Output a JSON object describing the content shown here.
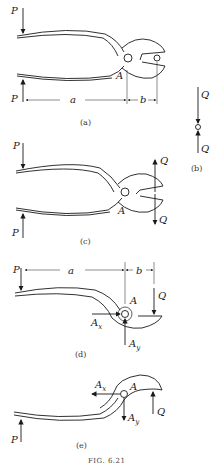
{
  "figure": {
    "caption": "FIG. 6.21",
    "panels": {
      "a": {
        "label": "(a)",
        "forces": {
          "top": "P",
          "bottom": "P"
        },
        "pivot": "A",
        "dimensions": {
          "handle": "a",
          "jaw": "b"
        }
      },
      "b": {
        "label": "(b)",
        "forces": {
          "top": "Q",
          "bottom": "Q"
        }
      },
      "c": {
        "label": "(c)",
        "forces": {
          "top_left": "P",
          "bottom_left": "P",
          "top_right": "Q",
          "bottom_right": "Q"
        },
        "pivot": "A"
      },
      "d": {
        "label": "(d)",
        "forces": {
          "load": "P",
          "jaw": "Q",
          "pin_x": "A",
          "pin_x_sub": "x",
          "pin_y": "A",
          "pin_y_sub": "y"
        },
        "pivot": "A",
        "dimensions": {
          "handle": "a",
          "jaw": "b"
        }
      },
      "e": {
        "label": "(e)",
        "forces": {
          "load": "P",
          "jaw": "Q",
          "pin_x": "A",
          "pin_x_sub": "x",
          "pin_y": "A",
          "pin_y_sub": "y"
        },
        "pivot": "A"
      }
    }
  }
}
